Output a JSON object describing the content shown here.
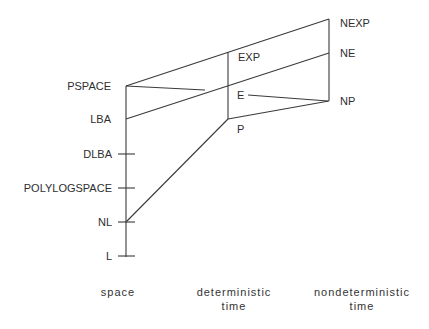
{
  "diagram": {
    "type": "complexity-class-hierarchy",
    "colors": {
      "line": "#3a3a3a",
      "text": "#2e2e2e",
      "background": "#ffffff"
    },
    "nodes": {
      "pspace": {
        "label": "PSPACE",
        "x": 126,
        "y": 86
      },
      "lba": {
        "label": "LBA",
        "x": 126,
        "y": 119
      },
      "dlba": {
        "label": "DLBA",
        "x": 126,
        "y": 154
      },
      "polylogspace": {
        "label": "POLYLOGSPACE",
        "x": 126,
        "y": 188
      },
      "nl": {
        "label": "NL",
        "x": 126,
        "y": 222
      },
      "l": {
        "label": "L",
        "x": 126,
        "y": 256
      },
      "exp": {
        "label": "EXP",
        "x": 228,
        "y": 52
      },
      "e": {
        "label": "E",
        "x": 248,
        "y": 95
      },
      "p": {
        "label": "P",
        "x": 228,
        "y": 119
      },
      "nexp": {
        "label": "NEXP",
        "x": 329,
        "y": 19
      },
      "ne": {
        "label": "NE",
        "x": 329,
        "y": 53
      },
      "np": {
        "label": "NP",
        "x": 329,
        "y": 101
      }
    },
    "edges": [
      [
        "PSPACE",
        "NEXP"
      ],
      [
        "PSPACE",
        "E-region (toward E)"
      ],
      [
        "LBA",
        "NE"
      ],
      [
        "EXP",
        "P"
      ],
      [
        "NEXP",
        "NP"
      ],
      [
        "E",
        "NP"
      ],
      [
        "P",
        "NP"
      ],
      [
        "NL",
        "P"
      ],
      [
        "PSPACE",
        "L"
      ]
    ],
    "axis_labels": {
      "space": "space",
      "deterministic_line1": "deterministic",
      "deterministic_line2": "time",
      "nondeterministic_line1": "nondeterministic",
      "nondeterministic_line2": "time"
    }
  }
}
